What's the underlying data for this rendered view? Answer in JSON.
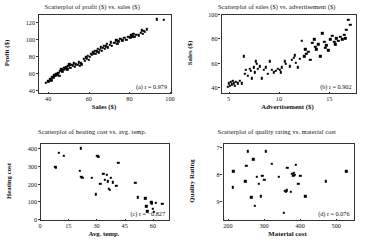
{
  "figure": {
    "background": "#ffffff",
    "point_color": "#000000",
    "axis_color": "#333333"
  },
  "chart_data": [
    {
      "type": "scatter",
      "panel": "a",
      "title": "Scatterplot of profit ($) vs. sales ($)",
      "annotation": "(a) r = 0.979",
      "r": 0.979,
      "xlabel": "Sales ($)",
      "ylabel": "Profit ($)",
      "xlim": [
        35,
        100
      ],
      "ylim": [
        38,
        130
      ],
      "xticks": [
        40,
        60,
        80,
        100
      ],
      "yticks": [
        40,
        60,
        80,
        100,
        120
      ],
      "grid": false,
      "points": [
        [
          38.5,
          50.0
        ],
        [
          39.5,
          52.0
        ],
        [
          40.5,
          55.0
        ],
        [
          41.0,
          53.0
        ],
        [
          41.5,
          57.0
        ],
        [
          42.0,
          56.0
        ],
        [
          42.5,
          59.0
        ],
        [
          43.0,
          58.0
        ],
        [
          43.5,
          61.0
        ],
        [
          44.0,
          60.0
        ],
        [
          44.5,
          62.0
        ],
        [
          45.0,
          58.0
        ],
        [
          45.5,
          64.0
        ],
        [
          46.0,
          66.0
        ],
        [
          46.5,
          63.0
        ],
        [
          47.0,
          65.0
        ],
        [
          47.5,
          68.0
        ],
        [
          48.0,
          67.0
        ],
        [
          48.5,
          69.0
        ],
        [
          49.0,
          66.0
        ],
        [
          49.5,
          70.0
        ],
        [
          50.0,
          72.0
        ],
        [
          50.5,
          68.0
        ],
        [
          51.0,
          71.0
        ],
        [
          51.5,
          70.0
        ],
        [
          52.0,
          73.0
        ],
        [
          52.5,
          69.0
        ],
        [
          53.0,
          72.0
        ],
        [
          54.0,
          71.0
        ],
        [
          54.5,
          74.0
        ],
        [
          55.0,
          70.0
        ],
        [
          55.5,
          73.0
        ],
        [
          56.0,
          72.0
        ],
        [
          57.0,
          78.0
        ],
        [
          57.5,
          76.0
        ],
        [
          58.0,
          80.0
        ],
        [
          58.5,
          79.0
        ],
        [
          59.0,
          82.0
        ],
        [
          59.5,
          77.0
        ],
        [
          60.0,
          81.0
        ],
        [
          60.5,
          84.0
        ],
        [
          61.0,
          83.0
        ],
        [
          61.5,
          86.0
        ],
        [
          62.0,
          85.0
        ],
        [
          62.5,
          88.0
        ],
        [
          63.0,
          84.0
        ],
        [
          63.5,
          87.0
        ],
        [
          64.0,
          90.0
        ],
        [
          64.5,
          86.0
        ],
        [
          65.0,
          89.0
        ],
        [
          65.5,
          92.0
        ],
        [
          66.0,
          88.0
        ],
        [
          66.5,
          91.0
        ],
        [
          67.0,
          94.0
        ],
        [
          67.5,
          90.0
        ],
        [
          68.0,
          93.0
        ],
        [
          68.5,
          96.0
        ],
        [
          69.0,
          92.0
        ],
        [
          70.0,
          95.0
        ],
        [
          70.5,
          98.0
        ],
        [
          71.0,
          94.0
        ],
        [
          72.0,
          97.0
        ],
        [
          73.0,
          100.0
        ],
        [
          73.5,
          96.0
        ],
        [
          74.0,
          99.0
        ],
        [
          75.0,
          102.0
        ],
        [
          76.0,
          100.0
        ],
        [
          77.0,
          103.0
        ],
        [
          78.0,
          101.0
        ],
        [
          79.0,
          104.0
        ],
        [
          80.0,
          103.0
        ],
        [
          80.5,
          106.0
        ],
        [
          81.0,
          105.0
        ],
        [
          81.5,
          108.0
        ],
        [
          82.0,
          104.0
        ],
        [
          83.0,
          107.0
        ],
        [
          84.0,
          106.0
        ],
        [
          85.0,
          109.0
        ],
        [
          85.5,
          112.0
        ],
        [
          86.0,
          108.0
        ],
        [
          86.5,
          111.0
        ],
        [
          87.0,
          110.0
        ],
        [
          88.0,
          113.0
        ],
        [
          93.0,
          125.0
        ],
        [
          96.5,
          124.0
        ]
      ]
    },
    {
      "type": "scatter",
      "panel": "b",
      "title": "Scatterplot of sales ($) vs. advertisement ($)",
      "annotation": "(b) r = 0.902",
      "r": 0.902,
      "xlabel": "Advertisement ($)",
      "ylabel": "Sales ($)",
      "xlim": [
        4.2,
        17.5
      ],
      "ylim": [
        36,
        100
      ],
      "xticks": [
        5,
        10,
        15
      ],
      "yticks": [
        40,
        60,
        80,
        100
      ],
      "grid": false,
      "points": [
        [
          4.8,
          41.0
        ],
        [
          4.9,
          44.0
        ],
        [
          5.0,
          42.0
        ],
        [
          5.1,
          45.0
        ],
        [
          5.2,
          43.0
        ],
        [
          5.3,
          46.0
        ],
        [
          5.4,
          44.0
        ],
        [
          5.5,
          42.0
        ],
        [
          5.6,
          45.0
        ],
        [
          5.8,
          44.0
        ],
        [
          6.0,
          46.0
        ],
        [
          6.2,
          44.0
        ],
        [
          6.4,
          66.0
        ],
        [
          6.5,
          52.0
        ],
        [
          6.6,
          55.0
        ],
        [
          6.8,
          50.0
        ],
        [
          7.0,
          56.0
        ],
        [
          7.1,
          54.0
        ],
        [
          7.2,
          48.0
        ],
        [
          7.4,
          57.0
        ],
        [
          7.5,
          53.0
        ],
        [
          7.6,
          62.0
        ],
        [
          7.7,
          60.0
        ],
        [
          7.8,
          56.0
        ],
        [
          8.0,
          58.0
        ],
        [
          8.2,
          48.0
        ],
        [
          8.4,
          55.0
        ],
        [
          8.6,
          57.0
        ],
        [
          8.8,
          52.0
        ],
        [
          9.0,
          62.0
        ],
        [
          9.2,
          55.0
        ],
        [
          9.4,
          53.0
        ],
        [
          9.6,
          54.0
        ],
        [
          9.8,
          56.0
        ],
        [
          10.0,
          55.0
        ],
        [
          10.1,
          53.0
        ],
        [
          10.2,
          57.0
        ],
        [
          10.5,
          62.0
        ],
        [
          10.6,
          60.0
        ],
        [
          11.0,
          58.0
        ],
        [
          11.2,
          63.0
        ],
        [
          11.4,
          65.0
        ],
        [
          11.5,
          67.0
        ],
        [
          11.6,
          61.0
        ],
        [
          11.8,
          57.0
        ],
        [
          12.0,
          64.0
        ],
        [
          12.2,
          79.0
        ],
        [
          12.4,
          66.0
        ],
        [
          12.5,
          72.0
        ],
        [
          12.6,
          68.0
        ],
        [
          12.8,
          70.0
        ],
        [
          13.0,
          63.0
        ],
        [
          13.2,
          77.0
        ],
        [
          13.4,
          80.0
        ],
        [
          13.5,
          74.0
        ],
        [
          13.6,
          72.0
        ],
        [
          13.8,
          76.0
        ],
        [
          14.0,
          66.0
        ],
        [
          14.2,
          85.0
        ],
        [
          14.4,
          78.0
        ],
        [
          14.5,
          73.0
        ],
        [
          14.6,
          75.0
        ],
        [
          14.8,
          71.0
        ],
        [
          15.0,
          80.0
        ],
        [
          15.2,
          83.0
        ],
        [
          15.4,
          78.0
        ],
        [
          15.5,
          76.0
        ],
        [
          15.6,
          81.0
        ],
        [
          15.8,
          79.0
        ],
        [
          16.0,
          82.0
        ],
        [
          16.2,
          80.0
        ],
        [
          16.4,
          84.0
        ],
        [
          16.5,
          81.0
        ],
        [
          16.6,
          88.0
        ],
        [
          16.8,
          96.0
        ],
        [
          17.0,
          92.0
        ]
      ]
    },
    {
      "type": "scatter",
      "panel": "c",
      "title": "Scatterplot of heating cost vs. avg. temp.",
      "annotation": "(c) r = −0.827",
      "r": -0.827,
      "xlabel": "Avg. temp.",
      "ylabel": "Heating cost",
      "xlim": [
        0,
        68
      ],
      "ylim": [
        0,
        430
      ],
      "xticks": [
        0,
        15,
        30,
        45,
        60
      ],
      "yticks": [
        0,
        100,
        200,
        300,
        400
      ],
      "grid": false,
      "points": [
        [
          7.5,
          300.0
        ],
        [
          8.0,
          296.0
        ],
        [
          9.5,
          380.0
        ],
        [
          12.0,
          362.0
        ],
        [
          21.0,
          405.0
        ],
        [
          20.5,
          277.0
        ],
        [
          21.5,
          243.0
        ],
        [
          22.0,
          240.0
        ],
        [
          27.0,
          240.0
        ],
        [
          29.0,
          145.0
        ],
        [
          30.0,
          362.0
        ],
        [
          30.5,
          357.0
        ],
        [
          31.5,
          205.0
        ],
        [
          33.0,
          262.0
        ],
        [
          34.0,
          228.0
        ],
        [
          35.0,
          255.0
        ],
        [
          35.5,
          218.0
        ],
        [
          36.0,
          175.0
        ],
        [
          36.5,
          170.0
        ],
        [
          37.0,
          238.0
        ],
        [
          38.0,
          213.0
        ],
        [
          40.0,
          195.0
        ],
        [
          41.0,
          325.0
        ],
        [
          50.0,
          210.0
        ],
        [
          51.5,
          128.0
        ],
        [
          55.5,
          122.0
        ],
        [
          56.0,
          78.0
        ],
        [
          56.5,
          50.0
        ],
        [
          58.5,
          100.0
        ],
        [
          59.0,
          95.0
        ],
        [
          59.5,
          65.0
        ],
        [
          60.0,
          48.0
        ],
        [
          61.0,
          98.0
        ],
        [
          64.5,
          93.0
        ]
      ]
    },
    {
      "type": "scatter",
      "panel": "d",
      "title": "Scatterplot of quality rating vs. material cost",
      "annotation": "(d) r = 0.076",
      "r": 0.076,
      "xlabel": "Material cost",
      "ylabel": "Quality Rating",
      "xlim": [
        185,
        545
      ],
      "ylim": [
        6.85,
        9.65
      ],
      "yticks": [
        9,
        8,
        7
      ],
      "xticks": [
        200,
        300,
        400,
        500
      ],
      "y_axis_inverted": true,
      "grid": false,
      "points": [
        [
          210,
          8.45
        ],
        [
          212,
          7.85
        ],
        [
          245,
          8.22
        ],
        [
          248,
          7.65
        ],
        [
          252,
          7.12
        ],
        [
          262,
          8.82
        ],
        [
          268,
          7.42
        ],
        [
          272,
          9.12
        ],
        [
          278,
          8.05
        ],
        [
          282,
          8.32
        ],
        [
          288,
          8.78
        ],
        [
          292,
          8.02
        ],
        [
          298,
          8.18
        ],
        [
          302,
          7.12
        ],
        [
          318,
          7.58
        ],
        [
          338,
          8.05
        ],
        [
          352,
          9.38
        ],
        [
          355,
          8.58
        ],
        [
          358,
          8.62
        ],
        [
          360,
          8.55
        ],
        [
          362,
          7.72
        ],
        [
          372,
          8.62
        ],
        [
          375,
          7.95
        ],
        [
          378,
          8.02
        ],
        [
          380,
          7.92
        ],
        [
          382,
          7.98
        ],
        [
          385,
          7.62
        ],
        [
          392,
          8.32
        ],
        [
          398,
          8.02
        ],
        [
          412,
          8.78
        ],
        [
          468,
          8.22
        ],
        [
          525,
          7.85
        ]
      ]
    }
  ]
}
